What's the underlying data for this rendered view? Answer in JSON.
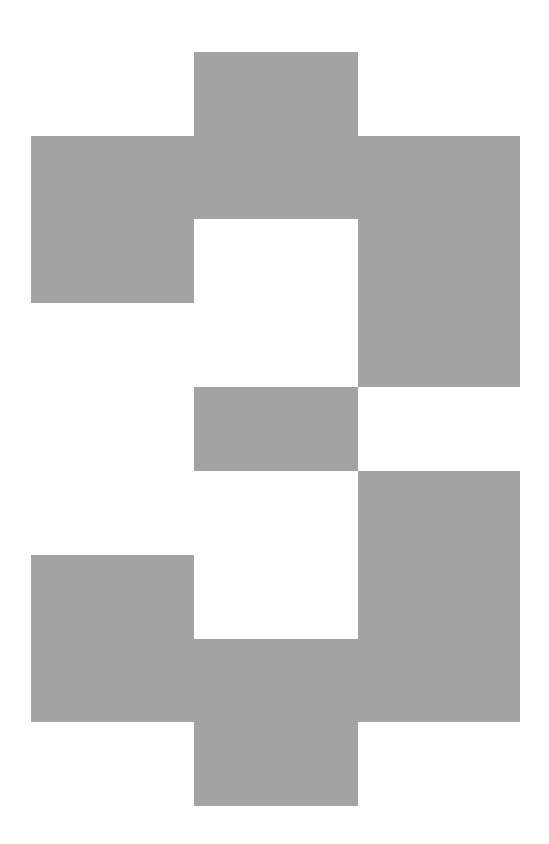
{
  "figure": {
    "glyph": "3",
    "fill_color": "#a3a3a3",
    "background_color": "#ffffff",
    "blocks": [
      {
        "name": "top-tab",
        "x": 194,
        "y": 52,
        "w": 164,
        "h": 84
      },
      {
        "name": "top-band",
        "x": 31,
        "y": 136,
        "w": 489,
        "h": 83
      },
      {
        "name": "upper-left-arm",
        "x": 31,
        "y": 219,
        "w": 163,
        "h": 84
      },
      {
        "name": "upper-right-column",
        "x": 358,
        "y": 219,
        "w": 162,
        "h": 168
      },
      {
        "name": "center-bar",
        "x": 194,
        "y": 387,
        "w": 164,
        "h": 84
      },
      {
        "name": "lower-right-column",
        "x": 358,
        "y": 471,
        "w": 162,
        "h": 168
      },
      {
        "name": "lower-left-arm",
        "x": 31,
        "y": 555,
        "w": 163,
        "h": 84
      },
      {
        "name": "bottom-band",
        "x": 31,
        "y": 639,
        "w": 489,
        "h": 83
      },
      {
        "name": "bottom-tab",
        "x": 194,
        "y": 722,
        "w": 164,
        "h": 84
      }
    ]
  }
}
